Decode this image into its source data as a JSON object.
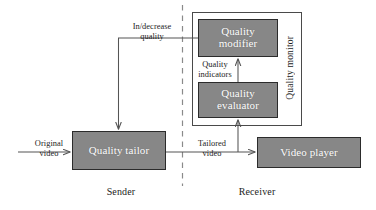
{
  "diagram": {
    "type": "block-flow-diagram",
    "colors": {
      "box_fill": "#878787",
      "box_border": "#2b2b2b",
      "box_text": "#ffffff",
      "line": "#555555",
      "frame": "#4a4a4a",
      "divider": "#8a8a8a",
      "background": "#ffffff"
    },
    "nodes": [
      {
        "id": "quality-tailor",
        "label": "Quality\ntailor",
        "side": "sender",
        "x": 72,
        "y": 131,
        "w": 94,
        "h": 39
      },
      {
        "id": "quality-modifier",
        "label": "Quality\nmodifier",
        "side": "receiver",
        "x": 198,
        "y": 19,
        "w": 80,
        "h": 38
      },
      {
        "id": "quality-evaluator",
        "label": "Quality\nevaluator",
        "side": "receiver",
        "x": 198,
        "y": 82,
        "w": 80,
        "h": 36
      },
      {
        "id": "video-player",
        "label": "Video player",
        "side": "receiver",
        "x": 257,
        "y": 137,
        "w": 104,
        "h": 31
      }
    ],
    "groups": [
      {
        "id": "quality-monitor",
        "label": "Quality monitor",
        "x": 192,
        "y": 12,
        "w": 110,
        "h": 114
      }
    ],
    "edge_labels": [
      {
        "id": "in-decrease-quality",
        "label": "In/decrease\nquality"
      },
      {
        "id": "original-video",
        "label": "Original\nvideo"
      },
      {
        "id": "tailored-video",
        "label": "Tailored\nvideo"
      },
      {
        "id": "quality-indicators",
        "label": "Quality\nindicators"
      }
    ],
    "section_labels": [
      {
        "id": "sender",
        "label": "Sender"
      },
      {
        "id": "receiver",
        "label": "Receiver"
      }
    ],
    "divider": {
      "id": "sender-receiver-divider",
      "style": "dashed",
      "x": 182,
      "y1": 5,
      "y2": 186
    }
  }
}
